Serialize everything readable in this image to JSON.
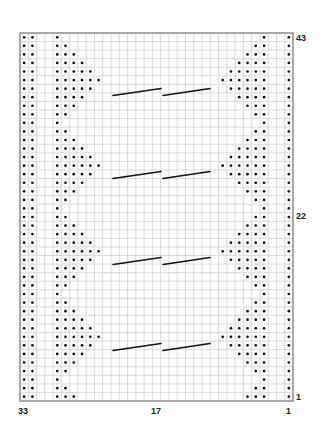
{
  "chart_data": {
    "type": "knitting-chart",
    "columns": 33,
    "rows": 43,
    "column_labels": [
      {
        "col": 33,
        "text": "33"
      },
      {
        "col": 17,
        "text": "17"
      },
      {
        "col": 1,
        "text": "1"
      }
    ],
    "row_labels": [
      {
        "row": 43,
        "text": "43"
      },
      {
        "row": 22,
        "text": "22"
      },
      {
        "row": 1,
        "text": "1"
      }
    ],
    "symbols": {
      "purl": "dot",
      "cable": "diagonal line"
    },
    "edge_purl_columns_left": [
      33,
      32
    ],
    "edge_purl_columns_right": [
      1
    ],
    "triangle_base_column_left": 29,
    "triangle_base_column_right": 4,
    "triangle_widths_by_row_1_to_43": [
      3,
      2,
      1,
      2,
      3,
      4,
      5,
      6,
      5,
      4,
      3,
      2,
      1,
      2,
      3,
      4,
      5,
      6,
      5,
      4,
      3,
      2,
      1,
      2,
      3,
      4,
      5,
      6,
      5,
      4,
      3,
      2,
      1,
      2,
      3,
      4,
      5,
      6,
      5,
      4,
      3,
      2,
      1
    ],
    "cable_rows_approx": [
      7,
      17,
      26,
      36
    ]
  },
  "labels": {
    "col_33": "33",
    "col_17": "17",
    "col_1": "1",
    "row_43": "43",
    "row_22": "22",
    "row_1": "1"
  },
  "colors": {
    "grid_line": "#d2d2d2",
    "border": "#a8a8a8",
    "dot": "#111111",
    "cable": "#111111"
  }
}
